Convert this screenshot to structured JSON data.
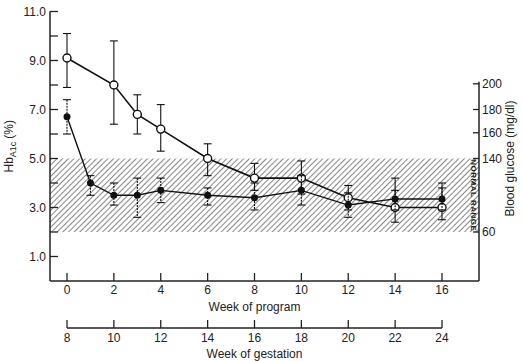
{
  "chart_data": {
    "type": "line",
    "title": "",
    "xlabel": "Week of program",
    "x2label": "Week of gestation",
    "ylabel": "HbA1c (%)",
    "ylabel_main": "Hb",
    "ylabel_sub": "A1c",
    "ylabel_unit": "(%)",
    "y2label": "Blood glucose (mg/dl)",
    "ylim": [
      0,
      11
    ],
    "xlim": [
      -0.7,
      17.3
    ],
    "grid": false,
    "legend": null,
    "x_ticks": [
      0,
      2,
      4,
      6,
      8,
      10,
      12,
      14,
      16
    ],
    "x_tick_labels": [
      "0",
      "2",
      "4",
      "6",
      "8",
      "10",
      "12",
      "14",
      "16"
    ],
    "x2_tick_labels": [
      "8",
      "10",
      "12",
      "14",
      "16",
      "18",
      "20",
      "22",
      "24"
    ],
    "y_ticks": [
      1,
      2,
      3,
      4,
      5,
      6,
      7,
      8,
      9,
      10,
      11
    ],
    "y_tick_labels": [
      "1.0",
      "3.0",
      "5.0",
      "7.0",
      "9.0",
      "11.0"
    ],
    "y_labeled_ticks": [
      1,
      3,
      5,
      7,
      9,
      11
    ],
    "y2_ticks": [
      {
        "label": "200",
        "y_left_equiv": 8.05
      },
      {
        "label": "180",
        "y_left_equiv": 7.0
      },
      {
        "label": "160",
        "y_left_equiv": 6.05
      },
      {
        "label": "140",
        "y_left_equiv": 5.0
      },
      {
        "label": "60",
        "y_left_equiv": 2.0
      }
    ],
    "normal_range": {
      "label": "NORMAL RANGE",
      "y_min": 2.0,
      "y_max": 5.0
    },
    "series": [
      {
        "name": "HbA1c",
        "marker": "open-circle",
        "x": [
          0,
          2,
          3,
          4,
          6,
          8,
          10,
          12,
          14,
          16
        ],
        "values": [
          9.1,
          8.0,
          6.8,
          6.2,
          5.0,
          4.2,
          4.2,
          3.4,
          3.0,
          3.0
        ],
        "err_low": [
          7.9,
          6.4,
          6.0,
          5.3,
          4.3,
          3.7,
          3.55,
          2.9,
          2.4,
          2.5
        ],
        "err_high": [
          10.1,
          9.8,
          7.6,
          7.2,
          5.6,
          4.8,
          4.9,
          3.9,
          4.2,
          4.0
        ]
      },
      {
        "name": "Blood glucose",
        "marker": "filled-circle",
        "x": [
          0,
          1,
          2,
          3,
          4,
          6,
          8,
          10,
          12,
          14,
          16
        ],
        "values": [
          6.7,
          4.0,
          3.5,
          3.5,
          3.7,
          3.5,
          3.4,
          3.7,
          3.1,
          3.35,
          3.35
        ],
        "err_low": [
          6.0,
          3.5,
          3.1,
          2.6,
          3.2,
          3.1,
          2.9,
          3.1,
          2.6,
          2.9,
          2.9
        ],
        "err_high": [
          7.4,
          4.3,
          4.0,
          4.2,
          4.2,
          3.8,
          4.0,
          4.3,
          3.6,
          3.7,
          3.8
        ]
      }
    ]
  }
}
